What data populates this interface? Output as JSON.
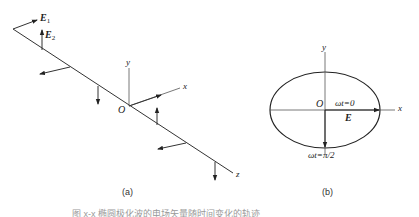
{
  "figure_a": {
    "label_E1": "E",
    "label_E1_sub": "1",
    "label_E2": "E",
    "label_E2_sub": "2",
    "axis_y": "y",
    "axis_x": "x",
    "axis_z": "z",
    "origin": "O",
    "caption": "(a)"
  },
  "figure_b": {
    "axis_y": "y",
    "axis_x": "x",
    "origin": "O",
    "label_wt0": "ωt=0",
    "label_E": "E",
    "label_wt_pi2": "ωt=π/2",
    "caption": "(b)"
  },
  "figure_caption": "图 x-x  椭圆极化波的电场矢量随时间变化的轨迹"
}
